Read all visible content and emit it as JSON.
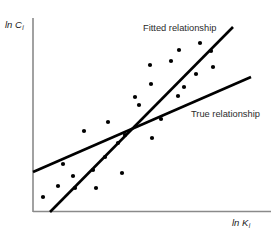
{
  "figure": {
    "background_color": "#ffffff",
    "width": 278,
    "height": 234
  },
  "axes": {
    "y_axis": {
      "label_main": "ln C",
      "label_sub": "i",
      "color": "#8a8a8a"
    },
    "x_axis": {
      "label_main": "ln K",
      "label_sub": "i",
      "color": "#8a8a8a"
    }
  },
  "annotations": {
    "fitted_label": "Fitted relationship",
    "true_label": "True relationship"
  },
  "chart_data": {
    "type": "scatter",
    "title": "",
    "xlabel": "ln K_i",
    "ylabel": "ln C_i",
    "grid": false,
    "legend_position": "inline-annotations",
    "marker_color": "#000000",
    "marker_size_px": 4.2,
    "axis_frame": {
      "y_axis_x": 33,
      "y_axis_top": 18,
      "y_axis_bottom": 212,
      "x_axis_y": 211.5,
      "x_axis_left": 33,
      "x_axis_right": 271
    },
    "points_px": [
      [
        43,
        197
      ],
      [
        58,
        186
      ],
      [
        73,
        176
      ],
      [
        75,
        188
      ],
      [
        96,
        188
      ],
      [
        93,
        170
      ],
      [
        63,
        164
      ],
      [
        105,
        157
      ],
      [
        122,
        173
      ],
      [
        84,
        131
      ],
      [
        108,
        122
      ],
      [
        118,
        143
      ],
      [
        125,
        135
      ],
      [
        152,
        138
      ],
      [
        139,
        105
      ],
      [
        161,
        119
      ],
      [
        135,
        97
      ],
      [
        151,
        84
      ],
      [
        178,
        96
      ],
      [
        184,
        87
      ],
      [
        150,
        65
      ],
      [
        171,
        61
      ],
      [
        196,
        74
      ],
      [
        179,
        50
      ],
      [
        200,
        43
      ],
      [
        211,
        51
      ],
      [
        213,
        67
      ]
    ],
    "series": [
      {
        "name": "Fitted relationship",
        "type": "line",
        "color": "#000000",
        "width_px": 2.6,
        "x1": 50,
        "y1": 212,
        "x2": 233,
        "y2": 27
      },
      {
        "name": "True relationship",
        "type": "line",
        "color": "#000000",
        "width_px": 2.6,
        "x1": 33,
        "y1": 172,
        "x2": 251,
        "y2": 77
      }
    ],
    "intersection_px": [
      128,
      133
    ]
  }
}
